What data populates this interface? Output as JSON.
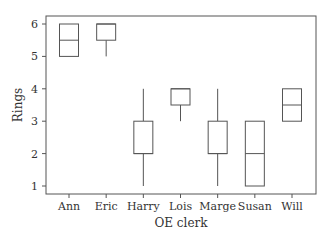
{
  "chart_data": {
    "type": "box",
    "title": "",
    "xlabel": "OE clerk",
    "ylabel": "Rings",
    "ylim": [
      0.85,
      6.3
    ],
    "yticks": [
      1,
      2,
      3,
      4,
      5,
      6
    ],
    "grid": false,
    "legend": null,
    "categories": [
      "Ann",
      "Eric",
      "Harry",
      "Lois",
      "Marge",
      "Susan",
      "Will"
    ],
    "boxes": [
      {
        "name": "Ann",
        "min": 5,
        "q1": 5,
        "median": 5.5,
        "q3": 6,
        "max": 6
      },
      {
        "name": "Eric",
        "min": 5,
        "q1": 5.5,
        "median": 6,
        "q3": 6,
        "max": 6
      },
      {
        "name": "Harry",
        "min": 1,
        "q1": 2,
        "median": 2,
        "q3": 3,
        "max": 4
      },
      {
        "name": "Lois",
        "min": 3,
        "q1": 3.5,
        "median": 4,
        "q3": 4,
        "max": 4
      },
      {
        "name": "Marge",
        "min": 1,
        "q1": 2,
        "median": 2,
        "q3": 3,
        "max": 4
      },
      {
        "name": "Susan",
        "min": 1,
        "q1": 1,
        "median": 2,
        "q3": 3,
        "max": 3
      },
      {
        "name": "Will",
        "min": 3,
        "q1": 3,
        "median": 3.5,
        "q3": 4,
        "max": 4
      }
    ]
  },
  "style": {
    "line_color": "#555555",
    "text_color": "#333333"
  }
}
